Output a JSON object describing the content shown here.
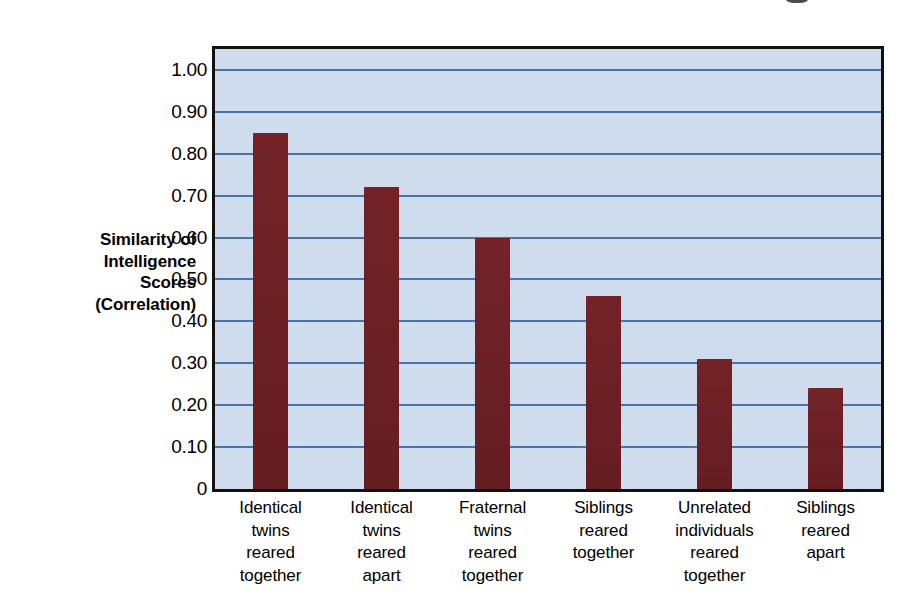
{
  "chart_data": {
    "type": "bar",
    "title": "",
    "xlabel": "",
    "ylabel": "Similarity of Intelligence Scores (Correlation)",
    "ylabel_lines": [
      "Similarity of",
      "Intelligence",
      "Scores",
      "(Correlation)"
    ],
    "categories": [
      "Identical twins reared together",
      "Identical twins reared apart",
      "Fraternal twins reared together",
      "Siblings reared together",
      "Unrelated individuals reared together",
      "Siblings reared apart"
    ],
    "category_lines": [
      [
        "Identical",
        "twins",
        "reared",
        "together"
      ],
      [
        "Identical",
        "twins",
        "reared",
        "apart"
      ],
      [
        "Fraternal",
        "twins",
        "reared",
        "together"
      ],
      [
        "Siblings",
        "reared",
        "together"
      ],
      [
        "Unrelated",
        "individuals",
        "reared",
        "together"
      ],
      [
        "Siblings",
        "reared",
        "apart"
      ]
    ],
    "values": [
      0.85,
      0.72,
      0.6,
      0.46,
      0.31,
      0.24
    ],
    "ylim": [
      0,
      1.05
    ],
    "ytick_values": [
      0,
      0.1,
      0.2,
      0.3,
      0.4,
      0.5,
      0.6,
      0.7,
      0.8,
      0.9,
      1.0
    ],
    "ytick_labels": [
      "0",
      "0.10",
      "0.20",
      "0.30",
      "0.40",
      "0.50",
      "0.60",
      "0.70",
      "0.80",
      "0.90",
      "1.00"
    ],
    "grid": true,
    "legend": "none",
    "colors": {
      "bar": "#6f2125",
      "plot_background": "#cfdced",
      "gridline": "#4a72a8",
      "frame": "#111111",
      "text": "#000000",
      "page_background": "#ffffff"
    }
  }
}
